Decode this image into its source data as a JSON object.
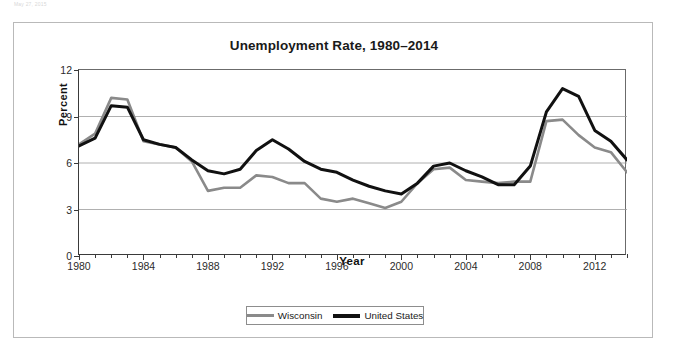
{
  "page": {
    "top_caption": "May 27, 2015"
  },
  "figure": {
    "title": "Unemployment Rate, 1980–2014"
  },
  "axes": {
    "y_label": "Percent",
    "x_label": "Year",
    "y_ticks": [
      "0",
      "3",
      "6",
      "9",
      "12"
    ],
    "x_ticks": [
      "1980",
      "1984",
      "1988",
      "1992",
      "1996",
      "2000",
      "2004",
      "2008",
      "2012"
    ]
  },
  "legend": {
    "items": [
      {
        "label": "Wisconsin",
        "color": "#8a8a8a"
      },
      {
        "label": "United States",
        "color": "#111111"
      }
    ]
  },
  "chart_data": {
    "type": "line",
    "title": "Unemployment Rate, 1980–2014",
    "xlabel": "Year",
    "ylabel": "Percent",
    "xlim": [
      1980,
      2014
    ],
    "ylim": [
      0,
      12
    ],
    "ytick_values": [
      0,
      3,
      6,
      9,
      12
    ],
    "xtick_values": [
      1980,
      1984,
      1988,
      1992,
      1996,
      2000,
      2004,
      2008,
      2012
    ],
    "grid": "horizontal",
    "legend_position": "bottom-center",
    "x": [
      1980,
      1981,
      1982,
      1983,
      1984,
      1985,
      1986,
      1987,
      1988,
      1989,
      1990,
      1991,
      1992,
      1993,
      1994,
      1995,
      1996,
      1997,
      1998,
      1999,
      2000,
      2001,
      2002,
      2003,
      2004,
      2005,
      2006,
      2007,
      2008,
      2009,
      2010,
      2011,
      2012,
      2013,
      2014
    ],
    "series": [
      {
        "name": "Wisconsin",
        "color": "#8a8a8a",
        "values": [
          7.2,
          7.9,
          10.2,
          10.1,
          7.4,
          7.2,
          7.0,
          6.1,
          4.2,
          4.4,
          4.4,
          5.2,
          5.1,
          4.7,
          4.7,
          3.7,
          3.5,
          3.7,
          3.4,
          3.1,
          3.5,
          4.7,
          5.6,
          5.7,
          4.9,
          4.8,
          4.7,
          4.8,
          4.8,
          8.7,
          8.8,
          7.8,
          7.0,
          6.7,
          5.4
        ]
      },
      {
        "name": "United States",
        "color": "#111111",
        "values": [
          7.1,
          7.6,
          9.7,
          9.6,
          7.5,
          7.2,
          7.0,
          6.2,
          5.5,
          5.3,
          5.6,
          6.8,
          7.5,
          6.9,
          6.1,
          5.6,
          5.4,
          4.9,
          4.5,
          4.2,
          4.0,
          4.7,
          5.8,
          6.0,
          5.5,
          5.1,
          4.6,
          4.6,
          5.8,
          9.3,
          10.8,
          10.3,
          8.1,
          7.4,
          6.2
        ]
      }
    ]
  }
}
